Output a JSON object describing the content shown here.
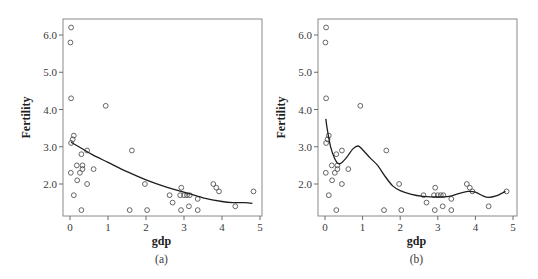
{
  "chart_data": [
    {
      "panel": "(a)",
      "type": "scatter",
      "caption": "(a)",
      "xlabel": "gdp",
      "ylabel": "Fertility",
      "xlim": [
        -0.15,
        5.05
      ],
      "ylim": [
        1.14,
        6.45
      ],
      "xticks": [
        0,
        1,
        2,
        3,
        4,
        5
      ],
      "xtick_labels": [
        "0",
        "1",
        "2",
        "3",
        "4",
        "5"
      ],
      "yticks": [
        2.0,
        3.0,
        4.0,
        5.0,
        6.0
      ],
      "ytick_labels": [
        "2.0",
        "3.0",
        "4.0",
        "5.0",
        "6.0"
      ],
      "grid": false,
      "series": [
        {
          "name": "observations",
          "marker": "open-circle",
          "points": [
            [
              0.03,
              6.2
            ],
            [
              0.01,
              5.8
            ],
            [
              0.03,
              4.3
            ],
            [
              0.94,
              4.1
            ],
            [
              0.1,
              3.3
            ],
            [
              0.07,
              3.2
            ],
            [
              0.03,
              3.1
            ],
            [
              0.45,
              2.9
            ],
            [
              0.3,
              2.8
            ],
            [
              1.63,
              2.9
            ],
            [
              0.18,
              2.5
            ],
            [
              0.33,
              2.5
            ],
            [
              0.33,
              2.4
            ],
            [
              0.62,
              2.4
            ],
            [
              0.02,
              2.3
            ],
            [
              0.26,
              2.3
            ],
            [
              0.19,
              2.1
            ],
            [
              0.45,
              2.0
            ],
            [
              1.97,
              2.0
            ],
            [
              0.1,
              1.7
            ],
            [
              0.3,
              1.3
            ],
            [
              1.57,
              1.3
            ],
            [
              2.03,
              1.3
            ],
            [
              2.62,
              1.7
            ],
            [
              2.7,
              1.5
            ],
            [
              2.93,
              1.9
            ],
            [
              2.9,
              1.7
            ],
            [
              2.92,
              1.3
            ],
            [
              3.0,
              1.7
            ],
            [
              3.08,
              1.7
            ],
            [
              3.15,
              1.7
            ],
            [
              3.13,
              1.4
            ],
            [
              3.36,
              1.6
            ],
            [
              3.36,
              1.3
            ],
            [
              3.77,
              2.0
            ],
            [
              3.85,
              1.9
            ],
            [
              3.92,
              1.8
            ],
            [
              4.35,
              1.4
            ],
            [
              4.83,
              1.8
            ]
          ]
        },
        {
          "name": "smooth fit",
          "type": "line",
          "points": [
            [
              0.03,
              3.12
            ],
            [
              0.3,
              2.96
            ],
            [
              0.6,
              2.78
            ],
            [
              1.0,
              2.58
            ],
            [
              1.5,
              2.33
            ],
            [
              2.0,
              2.11
            ],
            [
              2.5,
              1.93
            ],
            [
              3.0,
              1.78
            ],
            [
              3.5,
              1.63
            ],
            [
              4.0,
              1.53
            ],
            [
              4.3,
              1.5
            ],
            [
              4.6,
              1.5
            ],
            [
              4.8,
              1.48
            ]
          ]
        }
      ]
    },
    {
      "panel": "(b)",
      "type": "scatter",
      "caption": "(b)",
      "xlabel": "gdp",
      "ylabel": "Fertility",
      "xlim": [
        -0.15,
        5.05
      ],
      "ylim": [
        1.14,
        6.45
      ],
      "xticks": [
        0,
        1,
        2,
        3,
        4,
        5
      ],
      "xtick_labels": [
        "0",
        "1",
        "2",
        "3",
        "4",
        "5"
      ],
      "yticks": [
        2.0,
        3.0,
        4.0,
        5.0,
        6.0
      ],
      "ytick_labels": [
        "2.0",
        "3.0",
        "4.0",
        "5.0",
        "6.0"
      ],
      "grid": false,
      "series": [
        {
          "name": "observations",
          "marker": "open-circle",
          "points": [
            [
              0.03,
              6.2
            ],
            [
              0.01,
              5.8
            ],
            [
              0.03,
              4.3
            ],
            [
              0.94,
              4.1
            ],
            [
              0.1,
              3.3
            ],
            [
              0.07,
              3.2
            ],
            [
              0.03,
              3.1
            ],
            [
              0.45,
              2.9
            ],
            [
              0.3,
              2.8
            ],
            [
              1.63,
              2.9
            ],
            [
              0.18,
              2.5
            ],
            [
              0.33,
              2.5
            ],
            [
              0.33,
              2.4
            ],
            [
              0.62,
              2.4
            ],
            [
              0.02,
              2.3
            ],
            [
              0.26,
              2.3
            ],
            [
              0.19,
              2.1
            ],
            [
              0.45,
              2.0
            ],
            [
              1.97,
              2.0
            ],
            [
              0.1,
              1.7
            ],
            [
              0.3,
              1.3
            ],
            [
              1.57,
              1.3
            ],
            [
              2.03,
              1.3
            ],
            [
              2.62,
              1.7
            ],
            [
              2.7,
              1.5
            ],
            [
              2.93,
              1.9
            ],
            [
              2.9,
              1.7
            ],
            [
              2.92,
              1.3
            ],
            [
              3.0,
              1.7
            ],
            [
              3.08,
              1.7
            ],
            [
              3.15,
              1.7
            ],
            [
              3.13,
              1.4
            ],
            [
              3.36,
              1.6
            ],
            [
              3.36,
              1.3
            ],
            [
              3.77,
              2.0
            ],
            [
              3.85,
              1.9
            ],
            [
              3.92,
              1.8
            ],
            [
              4.35,
              1.4
            ],
            [
              4.83,
              1.8
            ]
          ]
        },
        {
          "name": "smooth fit",
          "type": "line",
          "points": [
            [
              0.02,
              3.75
            ],
            [
              0.08,
              3.35
            ],
            [
              0.15,
              3.0
            ],
            [
              0.25,
              2.7
            ],
            [
              0.35,
              2.55
            ],
            [
              0.45,
              2.58
            ],
            [
              0.6,
              2.75
            ],
            [
              0.75,
              2.95
            ],
            [
              0.88,
              3.02
            ],
            [
              1.0,
              2.92
            ],
            [
              1.2,
              2.7
            ],
            [
              1.4,
              2.5
            ],
            [
              1.6,
              2.2
            ],
            [
              1.8,
              1.95
            ],
            [
              2.0,
              1.82
            ],
            [
              2.3,
              1.72
            ],
            [
              2.6,
              1.67
            ],
            [
              3.0,
              1.65
            ],
            [
              3.3,
              1.67
            ],
            [
              3.55,
              1.74
            ],
            [
              3.8,
              1.8
            ],
            [
              4.0,
              1.78
            ],
            [
              4.2,
              1.68
            ],
            [
              4.35,
              1.64
            ],
            [
              4.55,
              1.68
            ],
            [
              4.7,
              1.75
            ],
            [
              4.8,
              1.8
            ]
          ]
        }
      ]
    }
  ]
}
